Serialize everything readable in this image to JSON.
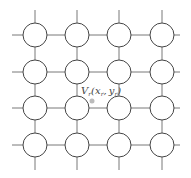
{
  "diagram": {
    "type": "grid network",
    "rows": 4,
    "cols": 4,
    "node_shape": "circle",
    "label": {
      "V": "V",
      "v_sub": "r",
      "open": "(",
      "x": "x",
      "x_sub": "r",
      "comma": ",",
      "y": "y",
      "y_sub": "r",
      "close": ")"
    },
    "point_color": "#bbbbbb",
    "line_color": "#555555"
  }
}
